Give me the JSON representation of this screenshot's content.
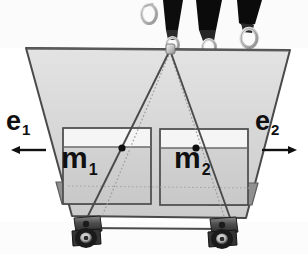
{
  "figure": {
    "type": "physics-schematic-photo-overlay",
    "canvas": {
      "width": 308,
      "height": 254,
      "background": "#ffffff"
    }
  },
  "labels": {
    "basis_left": {
      "base": "e",
      "sub": "1",
      "name": "e1"
    },
    "basis_right": {
      "base": "e",
      "sub": "2",
      "name": "e2"
    },
    "mass_left": {
      "base": "m",
      "sub": "1",
      "name": "m1"
    },
    "mass_right": {
      "base": "m",
      "sub": "2",
      "name": "m2"
    }
  },
  "arrows": {
    "left": {
      "direction": "left",
      "glyph": "←"
    },
    "right": {
      "direction": "right",
      "glyph": "→"
    }
  },
  "colors": {
    "outline": "#4a4a4a",
    "platform_fill": "#d4d4d4",
    "platform_fill_light": "#e2e2e2",
    "box_fill": "#cfcfcf",
    "box_band_fill": "#f4f4f4",
    "wedge_fill": "#8f8f8f",
    "strap_dark": "#101010",
    "metal_light": "#e8e8e8",
    "metal_mid": "#a8a8a8",
    "caster_dark": "#3a3a3a",
    "caster_mid": "#6e6e6e",
    "dot_color": "#101010",
    "dotted_line": "#8a8a8a",
    "text": "#101010"
  },
  "geometry": {
    "platform_top_left": [
      26,
      48
    ],
    "platform_top_right": [
      290,
      50
    ],
    "platform_bottom_left": [
      72,
      216
    ],
    "platform_bottom_right": [
      246,
      218
    ],
    "suspension_point": [
      170,
      50
    ],
    "mass_left_box": {
      "x": 63,
      "y": 128,
      "w": 88,
      "h": 76
    },
    "mass_right_box": {
      "x": 160,
      "y": 129,
      "w": 88,
      "h": 76
    },
    "com_left_dot": [
      122,
      148
    ],
    "com_right_dot": [
      196,
      148
    ],
    "caster_left": [
      88,
      228
    ],
    "caster_right": [
      223,
      229
    ]
  },
  "elements": {
    "platform": "trapezoidal-platform",
    "bottom_rail": "bottom-rail-bar",
    "straps": [
      {
        "name": "strap-1",
        "x": 152,
        "has_ring": true
      },
      {
        "name": "strap-2",
        "x": 195,
        "has_ring": true
      },
      {
        "name": "strap-3",
        "x": 238,
        "has_ring": true
      }
    ],
    "free_ring": {
      "name": "free-carabiner-ring",
      "x": 148,
      "y": 12
    },
    "wedges": [
      {
        "name": "wedge-left"
      },
      {
        "name": "wedge-right"
      }
    ],
    "sling_lines": [
      {
        "name": "sling-line-left",
        "from": [
          170,
          50
        ],
        "to": [
          82,
          222
        ]
      },
      {
        "name": "sling-line-right",
        "from": [
          170,
          50
        ],
        "to": [
          232,
          224
        ]
      }
    ],
    "dotted_guides": [
      {
        "name": "guide-left",
        "from": [
          170,
          52
        ],
        "to": [
          100,
          214
        ]
      },
      {
        "name": "guide-right",
        "from": [
          170,
          52
        ],
        "to": [
          226,
          216
        ]
      },
      {
        "name": "guide-horizontal",
        "from": [
          70,
          186
        ],
        "to": [
          248,
          188
        ]
      }
    ]
  }
}
